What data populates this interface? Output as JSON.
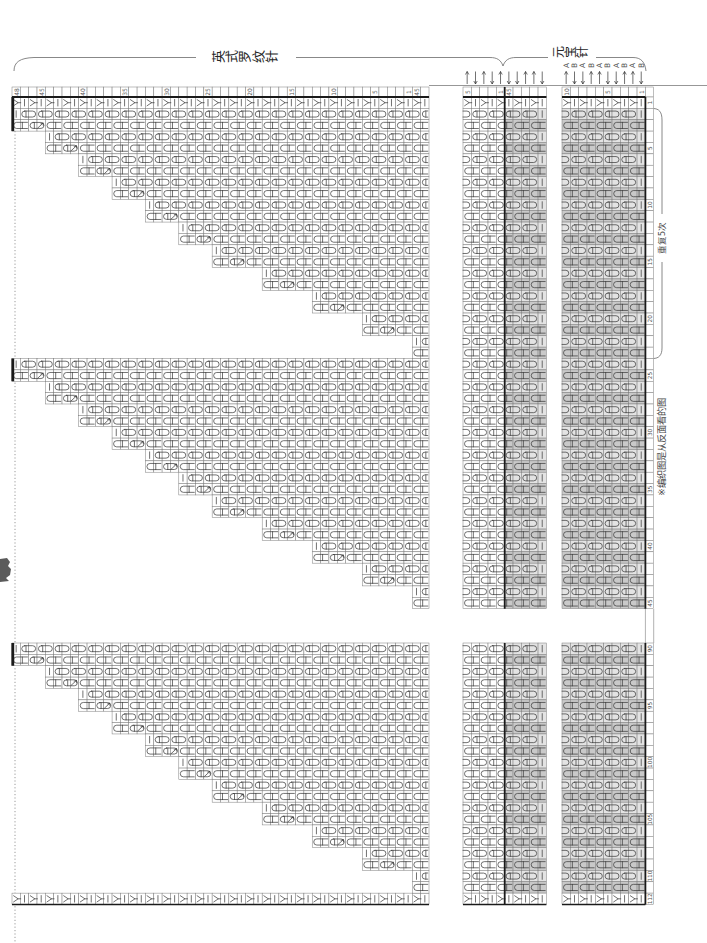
{
  "titles": {
    "english_rib": "英式罗纹针",
    "yuanbao": "元宝针",
    "repeat": "重复5次",
    "note": "※编织图是从反面看的图"
  },
  "layout": {
    "cell_w": 8.34,
    "cell_h": 11.37,
    "header_top": 87,
    "grid_top": 97,
    "upper_last": 45,
    "lower_first": 90,
    "lower_last": 112,
    "lower_top": 643,
    "strip": {
      "x": 645.4,
      "w": 8.3
    },
    "dotted_guide": {
      "x": 15,
      "y1": 97,
      "y2": 943
    }
  },
  "colors": {
    "grid": "#7c7c7c",
    "ink": "#333333",
    "thick": "#1a1a1a",
    "label": "#555555",
    "dotted": "#8e8e8e",
    "shade_dark": "#c9c9c9",
    "shade_light": "#e3e3e3"
  },
  "sections": [
    {
      "id": "english-rib-main",
      "x": 12,
      "cells": 50,
      "row_labels": [
        {
          "cell": 0,
          "text": "48"
        },
        {
          "cell": 3,
          "text": "45"
        },
        {
          "cell": 8,
          "text": "40"
        },
        {
          "cell": 13,
          "text": "35"
        },
        {
          "cell": 18,
          "text": "30"
        },
        {
          "cell": 23,
          "text": "25"
        },
        {
          "cell": 28,
          "text": "20"
        },
        {
          "cell": 33,
          "text": "15"
        },
        {
          "cell": 38,
          "text": "10"
        },
        {
          "cell": 43,
          "text": "5"
        },
        {
          "cell": 47,
          "text": "1"
        },
        {
          "cell": 48,
          "text": "45"
        }
      ]
    },
    {
      "id": "english-rib-sample",
      "x": 463,
      "cells": 10,
      "row_labels": [
        {
          "cell": 0,
          "text": "5"
        },
        {
          "cell": 4,
          "text": "1"
        },
        {
          "cell": 5,
          "text": "45"
        }
      ],
      "arrows": [
        "up",
        "down",
        "up",
        "down",
        "up",
        "down",
        "down",
        "up",
        "up",
        "down"
      ],
      "shade_from": 5,
      "thick_at": 5
    },
    {
      "id": "yuanbao-sample",
      "x": 562,
      "cells": 10,
      "row_labels": [
        {
          "cell": 0,
          "text": "10"
        },
        {
          "cell": 5,
          "text": "5"
        },
        {
          "cell": 9,
          "text": "1"
        }
      ],
      "arrows": [
        "up",
        "down",
        "down",
        "up",
        "up",
        "down",
        "down",
        "up",
        "up",
        "down"
      ],
      "letters": [
        "A",
        "B",
        "A",
        "B",
        "A",
        "B",
        "A",
        "B",
        "A",
        "B"
      ],
      "shade_from": 0,
      "thick_right": true
    }
  ],
  "column_labels": [
    {
      "col": 1,
      "text": "1"
    },
    {
      "col": 5,
      "text": "5"
    },
    {
      "col": 10,
      "text": "10"
    },
    {
      "col": 15,
      "text": "15"
    },
    {
      "col": 20,
      "text": "20"
    },
    {
      "col": 25,
      "text": "25"
    },
    {
      "col": 30,
      "text": "30"
    },
    {
      "col": 35,
      "text": "35"
    },
    {
      "col": 40,
      "text": "40"
    },
    {
      "col": 45,
      "text": "45"
    },
    {
      "col": 90,
      "text": "90"
    },
    {
      "col": 95,
      "text": "95"
    },
    {
      "col": 100,
      "text": "100"
    },
    {
      "col": 105,
      "text": "105"
    },
    {
      "col": 110,
      "text": "110"
    },
    {
      "col": 112,
      "text": "112"
    }
  ],
  "staircase": {
    "pair_offsets": [
      0,
      4,
      8,
      12,
      16,
      20,
      24,
      30,
      36,
      42,
      48
    ],
    "edge_rows": [
      1,
      112
    ],
    "triangles": [
      {
        "first_col": 2
      },
      {
        "first_col": 24
      },
      {
        "first_col": 90
      }
    ],
    "left_bars": [
      {
        "col": 1,
        "rows": 3
      },
      {
        "col": 24,
        "rows": 2
      },
      {
        "col": 90,
        "rows": 2
      }
    ]
  },
  "pattern_rules": {
    "edge_row_symbol": "increase-with-knit",
    "even_column_symbol": "slip-yarn-over",
    "odd_column_symbol": "brioche-knit",
    "second_symbol_in_odd_column": "slip-yarn-over-with-arrow"
  }
}
